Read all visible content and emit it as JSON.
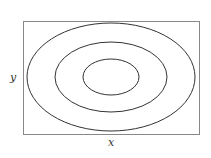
{
  "figure": {
    "type": "contour-diagram",
    "x_label": "x",
    "y_label": "y",
    "frame": {
      "x": 23,
      "y": 21,
      "width": 176,
      "height": 113,
      "stroke": "#888888"
    },
    "center": {
      "cx": 111,
      "cy": 77
    },
    "contours": [
      {
        "name": "outer",
        "rx": 84,
        "ry": 54
      },
      {
        "name": "middle",
        "rx": 56,
        "ry": 35
      },
      {
        "name": "inner",
        "rx": 28,
        "ry": 18
      }
    ],
    "contour_stroke": "#333333"
  }
}
